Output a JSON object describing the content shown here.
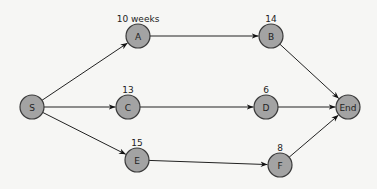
{
  "diagram": {
    "type": "activity-network",
    "nodes": [
      {
        "id": "S",
        "label": "S",
        "x": 32,
        "y": 107,
        "duration": ""
      },
      {
        "id": "A",
        "label": "A",
        "x": 138,
        "y": 36,
        "duration": "10 weeks"
      },
      {
        "id": "B",
        "label": "B",
        "x": 271,
        "y": 36,
        "duration": "14"
      },
      {
        "id": "C",
        "label": "C",
        "x": 128,
        "y": 107,
        "duration": "13"
      },
      {
        "id": "D",
        "label": "D",
        "x": 266,
        "y": 107,
        "duration": "6"
      },
      {
        "id": "E",
        "label": "E",
        "x": 137,
        "y": 160,
        "duration": "15"
      },
      {
        "id": "F",
        "label": "F",
        "x": 280,
        "y": 165,
        "duration": "8"
      },
      {
        "id": "End",
        "label": "End",
        "x": 348,
        "y": 107,
        "duration": ""
      }
    ],
    "edges": [
      {
        "from": "S",
        "to": "A"
      },
      {
        "from": "S",
        "to": "C"
      },
      {
        "from": "S",
        "to": "E"
      },
      {
        "from": "A",
        "to": "B"
      },
      {
        "from": "C",
        "to": "D"
      },
      {
        "from": "E",
        "to": "F"
      },
      {
        "from": "B",
        "to": "End"
      },
      {
        "from": "D",
        "to": "End"
      },
      {
        "from": "F",
        "to": "End"
      }
    ]
  }
}
